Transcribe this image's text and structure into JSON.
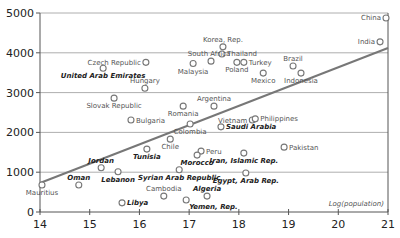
{
  "chart_data": {
    "type": "scatter",
    "title": "",
    "xlabel": "Log(population)",
    "ylabel": "",
    "xlim": [
      14,
      21
    ],
    "ylim": [
      0,
      5000
    ],
    "x_ticks": [
      14,
      15,
      16,
      17,
      18,
      19,
      20,
      21
    ],
    "y_ticks": [
      0,
      1000,
      2000,
      3000,
      4000,
      5000
    ],
    "grid": {
      "horizontal": true,
      "vertical": false
    },
    "legend": null,
    "colors": {
      "points": "#777777",
      "trendline": "#777777",
      "grid": "#999999",
      "axis": "#555555"
    },
    "trendline": {
      "x": [
        14,
        21
      ],
      "y": [
        730,
        4120
      ]
    },
    "points": [
      {
        "label": "China",
        "x": 20.96,
        "y": 4875,
        "emphasis": false,
        "label_pos": "left"
      },
      {
        "label": "India",
        "x": 20.84,
        "y": 4275,
        "emphasis": false,
        "label_pos": "left"
      },
      {
        "label": "Korea, Rep.",
        "x": 17.68,
        "y": 4150,
        "emphasis": false,
        "label_pos": "above"
      },
      {
        "label": "Thailand",
        "x": 17.66,
        "y": 3970,
        "emphasis": false,
        "label_pos": "right"
      },
      {
        "label": "South Africa",
        "x": 17.44,
        "y": 3790,
        "emphasis": false,
        "label_pos": "above-left"
      },
      {
        "label": "Malaysia",
        "x": 17.08,
        "y": 3730,
        "emphasis": false,
        "label_pos": "below"
      },
      {
        "label": "Poland",
        "x": 17.96,
        "y": 3760,
        "emphasis": false,
        "label_pos": "below"
      },
      {
        "label": "Turkey",
        "x": 18.1,
        "y": 3760,
        "emphasis": false,
        "label_pos": "right"
      },
      {
        "label": "Mexico",
        "x": 18.49,
        "y": 3490,
        "emphasis": false,
        "label_pos": "below"
      },
      {
        "label": "Brazil",
        "x": 19.09,
        "y": 3670,
        "emphasis": false,
        "label_pos": "above"
      },
      {
        "label": "Indonesia",
        "x": 19.25,
        "y": 3490,
        "emphasis": false,
        "label_pos": "below"
      },
      {
        "label": "Czech Republic",
        "x": 16.13,
        "y": 3760,
        "emphasis": false,
        "label_pos": "left"
      },
      {
        "label": "United Arab Emirates",
        "x": 15.27,
        "y": 3610,
        "emphasis": true,
        "label_pos": "below"
      },
      {
        "label": "Hungary",
        "x": 16.11,
        "y": 3110,
        "emphasis": false,
        "label_pos": "above"
      },
      {
        "label": "Slovak Republic",
        "x": 15.49,
        "y": 2860,
        "emphasis": false,
        "label_pos": "below"
      },
      {
        "label": "Bulgaria",
        "x": 15.83,
        "y": 2310,
        "emphasis": false,
        "label_pos": "right"
      },
      {
        "label": "Argentina",
        "x": 17.5,
        "y": 2660,
        "emphasis": false,
        "label_pos": "above"
      },
      {
        "label": "Romania",
        "x": 16.88,
        "y": 2660,
        "emphasis": false,
        "label_pos": "below"
      },
      {
        "label": "Colombia",
        "x": 17.02,
        "y": 2210,
        "emphasis": false,
        "label_pos": "below"
      },
      {
        "label": "Vietnam",
        "x": 18.27,
        "y": 2310,
        "emphasis": false,
        "label_pos": "left"
      },
      {
        "label": "Philippines",
        "x": 18.33,
        "y": 2340,
        "emphasis": false,
        "label_pos": "right"
      },
      {
        "label": "Saudi Arabia",
        "x": 17.64,
        "y": 2140,
        "emphasis": true,
        "label_pos": "right"
      },
      {
        "label": "Chile",
        "x": 16.62,
        "y": 1830,
        "emphasis": false,
        "label_pos": "below"
      },
      {
        "label": "Peru",
        "x": 17.24,
        "y": 1530,
        "emphasis": false,
        "label_pos": "right"
      },
      {
        "label": "Morocco",
        "x": 17.16,
        "y": 1430,
        "emphasis": true,
        "label_pos": "below"
      },
      {
        "label": "Iran, Islamic Rep.",
        "x": 18.1,
        "y": 1480,
        "emphasis": true,
        "label_pos": "below"
      },
      {
        "label": "Pakistan",
        "x": 18.91,
        "y": 1630,
        "emphasis": false,
        "label_pos": "right"
      },
      {
        "label": "Tunisia",
        "x": 16.15,
        "y": 1580,
        "emphasis": true,
        "label_pos": "below"
      },
      {
        "label": "Jordan",
        "x": 15.23,
        "y": 1110,
        "emphasis": true,
        "label_pos": "above"
      },
      {
        "label": "Lebanon",
        "x": 15.57,
        "y": 1010,
        "emphasis": true,
        "label_pos": "below"
      },
      {
        "label": "Oman",
        "x": 14.78,
        "y": 680,
        "emphasis": true,
        "label_pos": "above"
      },
      {
        "label": "Mauritius",
        "x": 14.04,
        "y": 680,
        "emphasis": false,
        "label_pos": "below"
      },
      {
        "label": "Libya",
        "x": 15.65,
        "y": 230,
        "emphasis": true,
        "label_pos": "right"
      },
      {
        "label": "Syrian Arab Republic",
        "x": 16.8,
        "y": 1060,
        "emphasis": true,
        "label_pos": "below"
      },
      {
        "label": "Egypt, Arab Rep.",
        "x": 18.14,
        "y": 980,
        "emphasis": true,
        "label_pos": "below"
      },
      {
        "label": "Cambodia",
        "x": 16.49,
        "y": 400,
        "emphasis": false,
        "label_pos": "above"
      },
      {
        "label": "Algeria",
        "x": 17.36,
        "y": 400,
        "emphasis": true,
        "label_pos": "above"
      },
      {
        "label": "Yemen, Rep.",
        "x": 16.94,
        "y": 300,
        "emphasis": true,
        "label_pos": "below-right"
      }
    ]
  }
}
